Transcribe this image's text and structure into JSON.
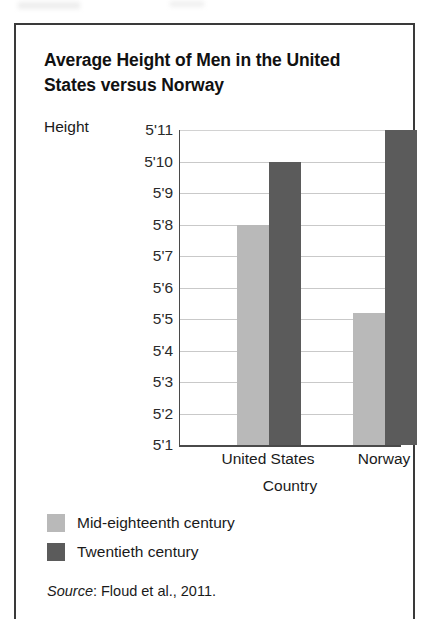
{
  "figure": {
    "title": "Average Height of Men in the United States versus Norway",
    "source_label": "Source",
    "source_text": ": Floud et al., 2011."
  },
  "colors": {
    "light_bar": "#b9b9b9",
    "dark_bar": "#5b5b5b",
    "gridline": "#c9c9c9",
    "axis": "#4a4a4a",
    "border": "#3a3a3a"
  },
  "chart_data": {
    "type": "bar",
    "title": "Average Height of Men in the United States versus Norway",
    "xlabel": "Country",
    "ylabel": "Height",
    "categories": [
      "United States",
      "Norway"
    ],
    "series": [
      {
        "name": "Mid-eighteenth century",
        "color": "#b9b9b9",
        "values": [
          68,
          65.2
        ],
        "value_labels": [
          "5'8",
          "5'5"
        ]
      },
      {
        "name": "Twentieth century",
        "color": "#5b5b5b",
        "values": [
          70,
          71
        ],
        "value_labels": [
          "5'10",
          "5'11"
        ]
      }
    ],
    "ylim": [
      61,
      71
    ],
    "ytick_values": [
      71,
      70,
      69,
      68,
      67,
      66,
      65,
      64,
      63,
      62,
      61
    ],
    "ytick_labels": [
      "5'11",
      "5'10",
      "5'9",
      "5'8",
      "5'7",
      "5'6",
      "5'5",
      "5'4",
      "5'3",
      "5'2",
      "5'1"
    ],
    "grid": true,
    "grid_axis": "y",
    "legend_position": "below-plot-left",
    "units": "inches"
  }
}
